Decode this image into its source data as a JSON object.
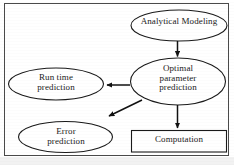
{
  "figure": {
    "type": "flowchart",
    "border_color": "#4a4a4a",
    "shape_color": "#1a1a1a",
    "background": "#ffffff"
  },
  "nodes": {
    "analytical_modeling": {
      "label": "Analytical Modeling",
      "shape": "ellipse"
    },
    "optimal_parameter_prediction": {
      "label": "Optimal\nparameter\nprediction",
      "shape": "ellipse"
    },
    "run_time_prediction": {
      "label": "Run time\nprediction",
      "shape": "ellipse"
    },
    "error_prediction": {
      "label": "Error\nprediction",
      "shape": "ellipse"
    },
    "computation": {
      "label": "Computation",
      "shape": "rectangle"
    }
  },
  "edges": [
    {
      "from": "analytical_modeling",
      "to": "optimal_parameter_prediction",
      "direction": "down"
    },
    {
      "from": "optimal_parameter_prediction",
      "to": "run_time_prediction",
      "direction": "left"
    },
    {
      "from": "optimal_parameter_prediction",
      "to": "error_prediction",
      "direction": "down-left"
    },
    {
      "from": "optimal_parameter_prediction",
      "to": "computation",
      "direction": "down"
    }
  ]
}
